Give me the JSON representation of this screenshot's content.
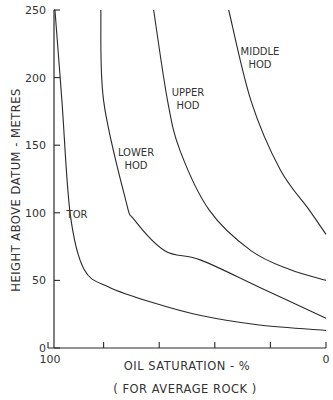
{
  "chart_data": {
    "type": "line",
    "title": "",
    "xlabel": "OIL SATURATION - %",
    "xlabel_sub": "( FOR AVERAGE ROCK )",
    "ylabel": "HEIGHT ABOVE DATUM - METRES",
    "xlim": [
      100,
      0
    ],
    "ylim": [
      0,
      250
    ],
    "x_reversed": true,
    "grid": false,
    "legend": "none (inline curve labels)",
    "x_tick_labels": [
      "100",
      "0"
    ],
    "x_ticks": [
      100,
      80,
      60,
      40,
      20,
      0
    ],
    "y_ticks": [
      0,
      50,
      100,
      150,
      200,
      250
    ],
    "y_tick_labels": [
      "0",
      "50",
      "100",
      "150",
      "200",
      "250"
    ],
    "series": [
      {
        "name": "TOR",
        "label_lines": [
          "TOR"
        ],
        "points": [
          [
            97.5,
            250
          ],
          [
            95,
            183
          ],
          [
            92,
            99
          ],
          [
            87,
            58
          ],
          [
            78,
            45
          ],
          [
            63,
            34
          ],
          [
            45,
            24
          ],
          [
            24,
            17
          ],
          [
            0,
            13
          ]
        ]
      },
      {
        "name": "LOWER HOD",
        "label_lines": [
          "LOWER",
          "HOD"
        ],
        "points": [
          [
            81,
            250
          ],
          [
            80,
            183
          ],
          [
            72,
            109
          ],
          [
            69,
            95
          ],
          [
            58,
            72
          ],
          [
            45,
            65
          ],
          [
            24,
            45
          ],
          [
            0,
            22
          ]
        ]
      },
      {
        "name": "UPPER HOD",
        "label_lines": [
          "UPPER",
          "HOD"
        ],
        "points": [
          [
            62,
            250
          ],
          [
            57,
            183
          ],
          [
            52.5,
            146
          ],
          [
            42,
            102
          ],
          [
            27,
            72
          ],
          [
            13,
            58
          ],
          [
            0,
            50
          ]
        ]
      },
      {
        "name": "MIDDLE HOD",
        "label_lines": [
          "MIDDLE",
          "HOD"
        ],
        "points": [
          [
            35,
            250
          ],
          [
            27,
            183
          ],
          [
            16.5,
            132
          ],
          [
            6,
            102
          ],
          [
            0,
            84
          ]
        ]
      }
    ]
  },
  "colors": {
    "line": "#2a2a2a",
    "background": "#ffffff"
  }
}
